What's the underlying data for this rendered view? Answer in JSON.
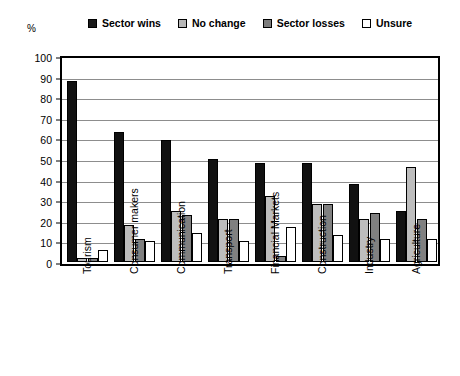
{
  "axis": {
    "unit": "%",
    "yticks": [
      0,
      10,
      20,
      30,
      40,
      50,
      60,
      70,
      80,
      90,
      100
    ]
  },
  "legend": {
    "items": [
      {
        "label": "Sector wins",
        "color": "#1a1a1a"
      },
      {
        "label": "No change",
        "color": "#b8b8b8"
      },
      {
        "label": "Sector losses",
        "color": "#7d7d7d"
      },
      {
        "label": "Unsure",
        "color": "#ffffff"
      }
    ]
  },
  "chart_data": {
    "type": "bar",
    "title": "",
    "xlabel": "",
    "ylabel": "%",
    "ylim": [
      0,
      100
    ],
    "grid": true,
    "legend_position": "top",
    "categories": [
      "Tourism",
      "Consumer makers",
      "Communication",
      "Transport",
      "Financial Markets",
      "Construction",
      "Industry",
      "Agriculture"
    ],
    "series": [
      {
        "name": "Sector wins",
        "color": "#1a1a1a",
        "values": [
          88,
          63,
          59,
          50,
          48,
          48,
          38,
          25
        ]
      },
      {
        "name": "No change",
        "color": "#b8b8b8",
        "values": [
          2,
          18,
          25,
          21,
          32,
          28,
          21,
          46
        ]
      },
      {
        "name": "Sector losses",
        "color": "#7d7d7d",
        "values": [
          2,
          11,
          23,
          21,
          3,
          28,
          24,
          21
        ]
      },
      {
        "name": "Unsure",
        "color": "#ffffff",
        "values": [
          6,
          10,
          14,
          10,
          17,
          13,
          11,
          11
        ]
      }
    ]
  }
}
